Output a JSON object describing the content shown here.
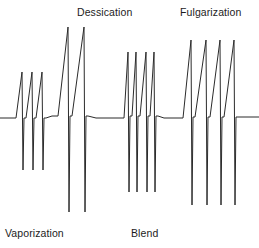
{
  "figure": {
    "background_color": "#ffffff",
    "line_color": "#2b2b2b",
    "line_width": 1,
    "width": 259,
    "height": 248
  },
  "labels": {
    "dessication": "Dessication",
    "fulgarization": "Fulgarization",
    "vaporization": "Vaporization",
    "blend": "Blend"
  },
  "chart_data": {
    "type": "line",
    "xlabel": "",
    "ylabel": "",
    "grid": false,
    "legend_position": "none",
    "axis_visible": false,
    "xlim": [
      0,
      259
    ],
    "ylim": [
      248,
      0
    ],
    "baseline_y": 118,
    "annotations": [
      {
        "text": "Dessication",
        "x": 77,
        "y": 12,
        "position": "above",
        "group": "dessication"
      },
      {
        "text": "Fulgarization",
        "x": 180,
        "y": 12,
        "position": "above",
        "group": "fulgarization"
      },
      {
        "text": "Vaporization",
        "x": 5,
        "y": 233,
        "position": "below",
        "group": "vaporization"
      },
      {
        "text": "Blend",
        "x": 131,
        "y": 233,
        "position": "below",
        "group": "blend"
      }
    ],
    "groups": [
      {
        "name": "vaporization",
        "label": "Vaporization",
        "spike_count": 3,
        "description": "Three sawtooth spikes: slow ramp up, sharp vertical drop well below baseline",
        "baseline_level": 118,
        "peak_y": 72,
        "trough_y": 170,
        "x_start": 10,
        "x_end": 50
      },
      {
        "name": "dessication",
        "label": "Dessication",
        "spike_count": 2,
        "description": "Two very tall narrow spikes spanning nearly the full figure height",
        "baseline_level": 118,
        "peak_y": 27,
        "trough_y": 212,
        "x_start": 62,
        "x_end": 95
      },
      {
        "name": "blend",
        "label": "Blend",
        "spike_count": 4,
        "description": "Four spikes arranged as two close pairs, medium-tall amplitude",
        "baseline_level": 118,
        "peak_y": 52,
        "trough_y": 192,
        "x_start": 122,
        "x_end": 166
      },
      {
        "name": "fulgarization",
        "label": "Fulgarization",
        "spike_count": 4,
        "description": "Four evenly spaced tall spikes with long downward tails",
        "baseline_level": 118,
        "peak_y": 40,
        "trough_y": 205,
        "x_start": 181,
        "x_end": 243
      }
    ],
    "series": [
      {
        "name": "output-waveform",
        "color": "#2b2b2b",
        "points": [
          [
            0,
            118
          ],
          [
            14,
            118
          ],
          [
            16,
            118
          ],
          [
            22,
            72
          ],
          [
            23,
            170
          ],
          [
            24,
            118
          ],
          [
            26,
            118
          ],
          [
            32,
            72
          ],
          [
            33,
            170
          ],
          [
            34,
            118
          ],
          [
            36,
            118
          ],
          [
            42,
            72
          ],
          [
            43,
            170
          ],
          [
            44,
            118
          ],
          [
            46,
            118
          ],
          [
            52,
            116
          ],
          [
            56,
            116
          ],
          [
            58,
            116
          ],
          [
            68,
            27
          ],
          [
            69,
            212
          ],
          [
            70,
            116
          ],
          [
            72,
            116
          ],
          [
            84,
            27
          ],
          [
            85,
            212
          ],
          [
            86,
            116
          ],
          [
            88,
            116
          ],
          [
            96,
            118
          ],
          [
            122,
            118
          ],
          [
            124,
            118
          ],
          [
            128,
            52
          ],
          [
            129,
            192
          ],
          [
            130,
            116
          ],
          [
            132,
            116
          ],
          [
            136,
            52
          ],
          [
            137,
            192
          ],
          [
            138,
            116
          ],
          [
            140,
            116
          ],
          [
            146,
            52
          ],
          [
            147,
            192
          ],
          [
            148,
            116
          ],
          [
            150,
            116
          ],
          [
            154,
            52
          ],
          [
            155,
            192
          ],
          [
            156,
            116
          ],
          [
            158,
            116
          ],
          [
            164,
            118
          ],
          [
            181,
            118
          ],
          [
            183,
            118
          ],
          [
            191,
            40
          ],
          [
            192,
            205
          ],
          [
            193,
            117
          ],
          [
            195,
            117
          ],
          [
            206,
            40
          ],
          [
            207,
            205
          ],
          [
            208,
            117
          ],
          [
            210,
            117
          ],
          [
            220,
            40
          ],
          [
            221,
            205
          ],
          [
            222,
            117
          ],
          [
            224,
            117
          ],
          [
            234,
            40
          ],
          [
            235,
            205
          ],
          [
            236,
            117
          ],
          [
            238,
            117
          ],
          [
            244,
            117
          ],
          [
            259,
            117
          ]
        ]
      }
    ]
  }
}
